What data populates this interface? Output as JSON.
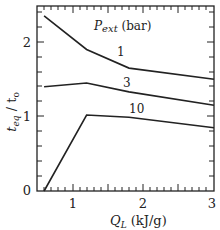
{
  "chart_data": {
    "type": "line",
    "title": "",
    "xlabel": "Q_L (kJ/g)",
    "ylabel": "t_eq / t_0",
    "xlim": [
      0.5,
      3.0
    ],
    "ylim": [
      0,
      2.48
    ],
    "xticks": [
      1,
      2,
      3
    ],
    "yticks": [
      0,
      1,
      2
    ],
    "grid": false,
    "legend_title": "P_ext (bar)",
    "series": [
      {
        "name": "1",
        "x": [
          0.6,
          1.2,
          1.8,
          3.0
        ],
        "y": [
          2.35,
          1.9,
          1.65,
          1.5
        ]
      },
      {
        "name": "3",
        "x": [
          0.6,
          1.2,
          1.8,
          3.0
        ],
        "y": [
          1.4,
          1.45,
          1.33,
          1.15
        ]
      },
      {
        "name": "10",
        "x": [
          0.6,
          1.2,
          1.8,
          3.0
        ],
        "y": [
          0.0,
          1.02,
          0.99,
          0.85
        ]
      }
    ]
  },
  "labels": {
    "xlabel_main": "Q",
    "xlabel_sub": "L",
    "xlabel_unit": " (kJ/g)",
    "ylabel_main": "t",
    "ylabel_sub": "eq",
    "ylabel_rest": " / t",
    "ylabel_sub2": "o",
    "legend_p": "P",
    "legend_sub": "ext",
    "legend_unit": " (bar)",
    "x1": "1",
    "x2": "2",
    "x3": "3",
    "y0": "0",
    "y1": "1",
    "y2": "2",
    "s1": "1",
    "s3": "3",
    "s10": "10"
  }
}
